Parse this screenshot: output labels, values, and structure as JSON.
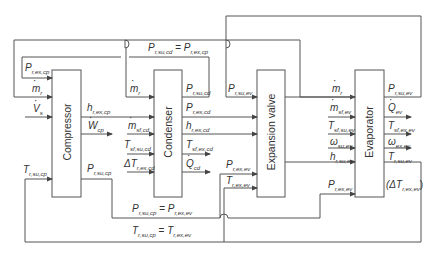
{
  "diagram": {
    "type": "block-diagram",
    "blocks": [
      {
        "id": "compressor",
        "label": "Compressor"
      },
      {
        "id": "condenser",
        "label": "Condenser"
      },
      {
        "id": "expansion_valve",
        "label": "Expansion valve"
      },
      {
        "id": "evaporator",
        "label": "Evaporator"
      }
    ],
    "equations": {
      "top": {
        "lhs": "P",
        "lhs_sub": "r,su,cd",
        "eq": "=",
        "rhs": "P",
        "rhs_sub": "r,ex,cp"
      },
      "bottom_p": {
        "lhs": "P",
        "lhs_sub": "r,su,cp",
        "eq": "=",
        "rhs": "P",
        "rhs_sub": "r,ex,ev"
      },
      "bottom_t": {
        "lhs": "T",
        "lhs_sub": "r,su,cp",
        "eq": "=",
        "rhs": "T",
        "rhs_sub": "r,ex,ev"
      }
    },
    "compressor_inputs": [
      {
        "sym": "P",
        "sub": "r,ex,cp",
        "dot": false
      },
      {
        "sym": "m",
        "sub": "r",
        "dot": true
      },
      {
        "sym": "V",
        "sub": "s",
        "dot": true
      },
      {
        "sym": "T",
        "sub": "r,su,cp",
        "dot": false
      }
    ],
    "compressor_outputs": [
      {
        "sym": "h",
        "sub": "r,ex,cp",
        "dot": false
      },
      {
        "sym": "W",
        "sub": "cp",
        "dot": true
      },
      {
        "sym": "P",
        "sub": "r,su,cp",
        "dot": false
      }
    ],
    "condenser_inputs": [
      {
        "sym": "m",
        "sub": "r",
        "dot": true
      },
      {
        "sym": "m",
        "sub": "sf,cd",
        "dot": true
      },
      {
        "sym": "T",
        "sub": "sf,su,cd",
        "dot": false
      },
      {
        "sym": "ΔT",
        "sub": "r,ex,cd",
        "dot": false
      }
    ],
    "condenser_outputs": [
      {
        "sym": "P",
        "sub": "r,su,cd",
        "dot": false
      },
      {
        "sym": "P",
        "sub": "r,ex,cd",
        "dot": false
      },
      {
        "sym": "h",
        "sub": "r,ex,cd",
        "dot": false
      },
      {
        "sym": "T",
        "sub": "sf,ex,cd",
        "dot": false
      },
      {
        "sym": "Q",
        "sub": "cd",
        "dot": true
      }
    ],
    "expansion_inputs": [
      {
        "sym": "P",
        "sub": "r,su,ev",
        "dot": false
      },
      {
        "sym": "P",
        "sub": "r,ex,ev",
        "dot": false
      },
      {
        "sym": "T",
        "sub": "r,ex,ev",
        "dot": false
      }
    ],
    "evaporator_inputs": [
      {
        "sym": "m",
        "sub": "r",
        "dot": true
      },
      {
        "sym": "m",
        "sub": "sf,ev",
        "dot": true
      },
      {
        "sym": "T",
        "sub": "sf,su,ev",
        "dot": false
      },
      {
        "sym": "ω",
        "sub": "su,ev",
        "dot": false
      },
      {
        "sym": "h",
        "sub": "r,su,ev",
        "dot": false
      },
      {
        "sym": "P",
        "sub": "r,ex,ev",
        "dot": false
      }
    ],
    "evaporator_outputs": [
      {
        "sym": "P",
        "sub": "r,su,ev",
        "dot": false
      },
      {
        "sym": "Q",
        "sub": "ev",
        "dot": true
      },
      {
        "sym": "T",
        "sub": "sf,ex,ev",
        "dot": false
      },
      {
        "sym": "ω",
        "sub": "ex,ev",
        "dot": false
      },
      {
        "sym": "T",
        "sub": "r,su,ev",
        "dot": false
      },
      {
        "sym": "(ΔT",
        "sub": "r,ex,ev",
        "suffix": ")",
        "dot": false
      }
    ]
  }
}
